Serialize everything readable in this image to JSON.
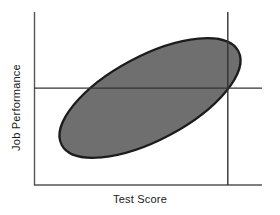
{
  "figure": {
    "background_color": "#ffffff",
    "axis_color": "#555555",
    "cutoff_line_color": "#333333",
    "ellipse_fill_color": "#6f6f6f",
    "ellipse_stroke_color": "#1c1c1c"
  },
  "axes": {
    "x_label": "Test Score",
    "y_label": "Job Performance"
  },
  "chart_data": {
    "type": "scatter",
    "title": "",
    "subtitle": "",
    "xlabel": "Test Score",
    "ylabel": "Job Performance",
    "xlim": [
      0,
      100
    ],
    "ylim": [
      0,
      100
    ],
    "grid": false,
    "legend": null,
    "annotations": [
      {
        "name": "data-cloud-ellipse",
        "shape": "ellipse",
        "center_x": 51,
        "center_y": 56,
        "semi_major": 47,
        "semi_minor": 20,
        "rotation_deg": 28,
        "fill": "#6f6f6f",
        "stroke": "#1c1c1c",
        "meaning": "Region containing the scatter of applicants"
      },
      {
        "name": "job-performance-cutoff",
        "shape": "horizontal-line",
        "y": 56,
        "x_start": 0,
        "x_end": 100,
        "meaning": "Minimum acceptable job performance"
      },
      {
        "name": "test-score-cutoff",
        "shape": "vertical-line",
        "x": 85,
        "y_start": 0,
        "y_end": 100,
        "meaning": "Selection cutoff on the test score"
      }
    ],
    "series": [
      {
        "name": "Applicants",
        "correlation": "positive",
        "x": [],
        "y": []
      }
    ]
  }
}
